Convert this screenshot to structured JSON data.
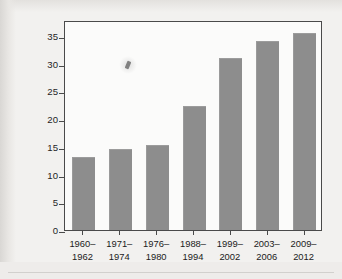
{
  "figure": {
    "ylabel": "Percentage of population that is obese"
  },
  "chart_data": {
    "type": "bar",
    "title": "",
    "subtitle": "",
    "xlabel": "",
    "ylabel": "Percentage of population that is obese",
    "categories": [
      "1960–\n1962",
      "1971–\n1974",
      "1976–\n1980",
      "1988–\n1994",
      "1999–\n2002",
      "2003–\n2006",
      "2009–\n2012"
    ],
    "category_lines": [
      [
        "1960–",
        "1962"
      ],
      [
        "1971–",
        "1974"
      ],
      [
        "1976–",
        "1980"
      ],
      [
        "1988–",
        "1994"
      ],
      [
        "1999–",
        "2002"
      ],
      [
        "2003–",
        "2006"
      ],
      [
        "2009–",
        "2012"
      ]
    ],
    "values": [
      13.2,
      14.6,
      15.3,
      22.4,
      31.0,
      34.1,
      35.6
    ],
    "ylim": [
      0,
      37.9
    ],
    "yticks": [
      0,
      5,
      10,
      15,
      20,
      25,
      30,
      35
    ],
    "ytick_labels": [
      "0",
      "5",
      "10",
      "15",
      "20",
      "25",
      "30",
      "35"
    ],
    "grid": false,
    "legend": false,
    "legend_position": "none",
    "bar_color": "#8d8d8d",
    "frame_color": "#4a4a4a",
    "plot_background": "#fbfbfa",
    "page_background": "#f2f1ef"
  }
}
